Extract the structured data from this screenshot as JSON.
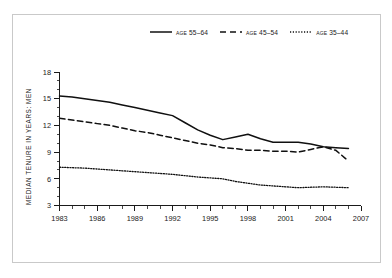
{
  "figure": {
    "background_color": "#ffffff",
    "frame_color": "#c9c9c9",
    "ink_color": "#101010"
  },
  "legend": {
    "position": "top-center",
    "entries": [
      {
        "label": "age 55–64",
        "style": "solid",
        "swatch_name": "legend-swatch-solid"
      },
      {
        "label": "age 45–54",
        "style": "dashed",
        "swatch_name": "legend-swatch-dashed"
      },
      {
        "label": "age 35–44",
        "style": "dotted",
        "swatch_name": "legend-swatch-dotted"
      }
    ]
  },
  "axes": {
    "y_title": "MEDIAN TENURE IN YEARS: MEN",
    "y_ticks": [
      "3",
      "6",
      "9",
      "12",
      "15",
      "18"
    ],
    "x_ticks": [
      "1983",
      "1986",
      "1989",
      "1992",
      "1995",
      "1998",
      "2001",
      "2004",
      "2007"
    ]
  },
  "chart_data": {
    "type": "line",
    "title": "",
    "subtitle": "",
    "xlabel": "",
    "ylabel": "MEDIAN TENURE IN YEARS: MEN",
    "xlim": [
      1983,
      2007
    ],
    "ylim": [
      3,
      18
    ],
    "y_ticks": [
      3,
      6,
      9,
      12,
      15,
      18
    ],
    "x_ticks": [
      1983,
      1986,
      1989,
      1992,
      1995,
      1998,
      2001,
      2004,
      2007
    ],
    "x_minor_tick_step": 1,
    "grid": false,
    "legend_position": "top-center",
    "x": [
      1983,
      1984,
      1985,
      1986,
      1987,
      1988,
      1989,
      1990,
      1991,
      1992,
      1993,
      1994,
      1995,
      1996,
      1997,
      1998,
      1999,
      2000,
      2001,
      2002,
      2003,
      2004,
      2005,
      2006
    ],
    "series": [
      {
        "name": "age 55–64",
        "style": "solid",
        "values": [
          15.3,
          15.2,
          15.0,
          14.8,
          14.6,
          14.3,
          14.0,
          13.7,
          13.4,
          13.1,
          12.3,
          11.5,
          10.9,
          10.4,
          10.7,
          11.0,
          10.5,
          10.1,
          10.1,
          10.1,
          9.9,
          9.6,
          9.5,
          9.4
        ]
      },
      {
        "name": "age 45–54",
        "style": "dashed",
        "values": [
          12.8,
          12.6,
          12.4,
          12.2,
          12.0,
          11.7,
          11.4,
          11.2,
          10.9,
          10.6,
          10.3,
          10.0,
          9.8,
          9.5,
          9.4,
          9.2,
          9.2,
          9.1,
          9.1,
          9.0,
          9.3,
          9.6,
          9.2,
          8.0
        ]
      },
      {
        "name": "age 35–44",
        "style": "dotted",
        "values": [
          7.3,
          7.25,
          7.2,
          7.1,
          7.0,
          6.9,
          6.8,
          6.7,
          6.6,
          6.5,
          6.35,
          6.2,
          6.1,
          6.0,
          5.7,
          5.5,
          5.3,
          5.2,
          5.1,
          5.0,
          5.05,
          5.1,
          5.05,
          5.0
        ]
      }
    ]
  }
}
